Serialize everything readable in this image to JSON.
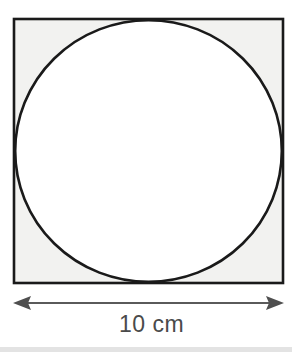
{
  "figure": {
    "shapes": {
      "square": {
        "name": "square",
        "x": 14,
        "y": 19,
        "size": 269,
        "fill_color": "#f2f2f0",
        "stroke_color": "#1a1a1a",
        "stroke_width": 2.6
      },
      "circle": {
        "name": "inscribed-circle",
        "cx": 148.5,
        "cy": 153.5,
        "r": 133.2,
        "fill_color": "#ffffff",
        "stroke_color": "#1a1a1a",
        "stroke_width": 2.6
      }
    },
    "dimension": {
      "name": "width-dimension",
      "label": "10 cm",
      "value": 10,
      "unit": "cm",
      "text_color": "#4a4a4a",
      "line_color": "#5a5a5a",
      "line_y": 303,
      "x_start": 13,
      "x_end": 284,
      "arrow_style": "double-headed"
    },
    "footer_rule": {
      "name": "bottom-rule",
      "color": "#e3e3e3"
    }
  }
}
